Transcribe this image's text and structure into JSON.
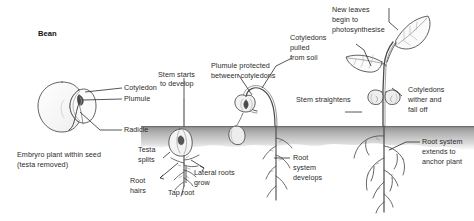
{
  "diagram": {
    "title": "Bean",
    "type": "bean-seed-germination-sequence",
    "seed_panel": {
      "labels": {
        "cotyledon": "Cotyledon",
        "plumule": "Plumule",
        "radicle": "Radicle"
      },
      "caption_line1": "Embryro plant within seed",
      "caption_line2": "(testa removed)"
    },
    "stage2": {
      "stem_starts_l1": "Stem starts",
      "stem_starts_l2": "to develop",
      "testa_l1": "Testa",
      "testa_l2": "splits",
      "root_hairs_l1": "Root",
      "root_hairs_l2": "hairs",
      "lateral_l1": "Lateral roots",
      "lateral_l2": "grow",
      "tap_root": "Tap root"
    },
    "stage3": {
      "plumule_l1": "Plumule protected",
      "plumule_l2": "between cotyledons",
      "cotyledons_pulled_l1": "Cotyledons",
      "cotyledons_pulled_l2": "pulled",
      "cotyledons_pulled_l3": "from soil",
      "root_system_l1": "Root",
      "root_system_l2": "system",
      "root_system_l3": "develops"
    },
    "stage4": {
      "new_leaves_l1": "New leaves",
      "new_leaves_l2": "begin to",
      "new_leaves_l3": "photosynthesise",
      "stem_straightens": "Stem straightens",
      "cotyledons_wither_l1": "Cotyledons",
      "cotyledons_wither_l2": "wither and",
      "cotyledons_wither_l3": "fall off",
      "root_extends_l1": "Root system",
      "root_extends_l2": "extends to",
      "root_extends_l3": "anchor plant"
    },
    "colors": {
      "ink": "#2b2b2b",
      "soil_dark": "#8d8d8d",
      "soil_light": "#d8d8d8",
      "background": "#ffffff"
    }
  }
}
